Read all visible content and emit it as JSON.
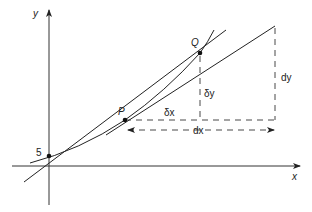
{
  "diagram": {
    "axes": {
      "x_label": "x",
      "y_label": "y"
    },
    "intercept_label": "5",
    "points": {
      "P": "P",
      "Q": "Q"
    },
    "labels": {
      "delta_x": "δx",
      "delta_y": "δy",
      "dx": "dx",
      "dy": "dy"
    },
    "colors": {
      "stroke": "#222222",
      "dashed": "#333333",
      "background": "#ffffff"
    }
  }
}
